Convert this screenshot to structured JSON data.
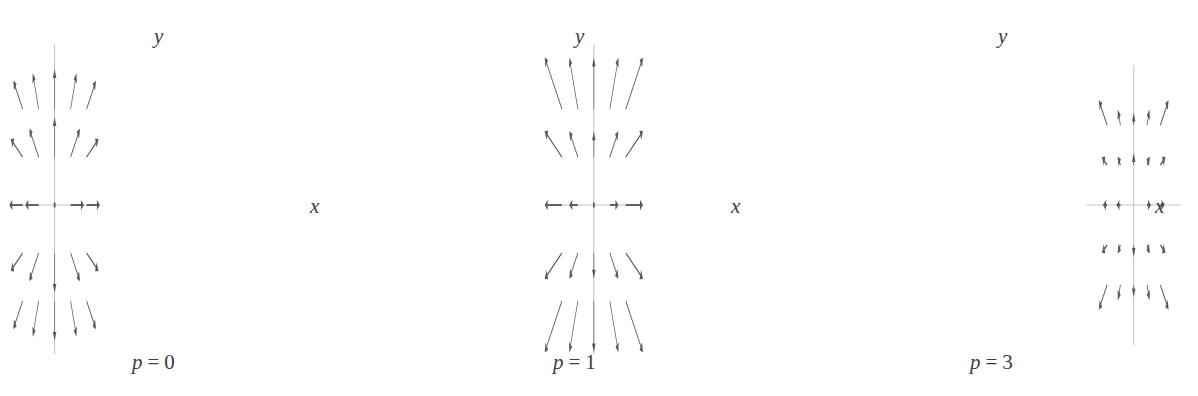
{
  "figure": {
    "width": 1198,
    "height": 396,
    "background": "#ffffff",
    "stroke_color": "#5a5a5a",
    "axis_color": "#9a9a9a",
    "label_color": "#3d3d3d"
  },
  "chart_data": {
    "type": "scatter",
    "subtype": "vector-field-quiver",
    "title": "",
    "panels": [
      {
        "id": "panel-p0",
        "caption": "p = 0",
        "caption_var": "p",
        "caption_eq": "=",
        "caption_value": "0",
        "exponent": 0,
        "xlabel": "x",
        "ylabel": "y",
        "origin": [
          164,
          205
        ],
        "grid_spacing": 48,
        "grid_range": [
          -2,
          -1,
          1,
          2
        ],
        "axis_x_extent": [
          -2.72,
          2.72
        ],
        "axis_y_extent": [
          -3.1,
          3.35
        ],
        "arrow_scale": 40,
        "arrow_min_length": 40,
        "head_length": 9,
        "head_width": 5.2,
        "shaft_width": 1.9,
        "axis_label_pos": [
          310,
          196
        ],
        "caption_pos": [
          132,
          352
        ],
        "ylabel_pos": [
          154,
          26
        ]
      },
      {
        "id": "panel-p1",
        "caption": "p = 1",
        "caption_var": "p",
        "caption_eq": "=",
        "caption_value": "1",
        "exponent": 1,
        "xlabel": "x",
        "ylabel": "y",
        "origin": [
          585,
          205
        ],
        "grid_spacing": 48,
        "grid_range": [
          -2,
          -1,
          1,
          2
        ],
        "axis_x_extent": [
          -2.72,
          2.72
        ],
        "axis_y_extent": [
          -3.1,
          3.35
        ],
        "arrow_scale": 30,
        "arrow_min_length": 30,
        "head_length": 9,
        "head_width": 5.2,
        "shaft_width": 1.9,
        "axis_label_pos": [
          731,
          196
        ],
        "caption_pos": [
          553,
          352
        ],
        "ylabel_pos": [
          575,
          26
        ]
      },
      {
        "id": "panel-p3",
        "caption": "p = 3",
        "caption_var": "p",
        "caption_eq": "=",
        "caption_value": "3",
        "exponent": 3,
        "xlabel": "x",
        "ylabel": "y",
        "origin": [
          1008,
          205
        ],
        "grid_spacing": 40,
        "grid_range": [
          -2,
          -1,
          1,
          2
        ],
        "axis_x_extent": [
          -3.55,
          3.55
        ],
        "axis_y_extent": [
          -3.5,
          3.5
        ],
        "arrow_scale": 18,
        "arrow_min_length": 12,
        "head_length": 9,
        "head_width": 5.2,
        "shaft_width": 2.3,
        "axis_label_pos": [
          1155,
          196
        ],
        "caption_pos": [
          970,
          352
        ],
        "ylabel_pos": [
          998,
          26
        ]
      }
    ]
  }
}
